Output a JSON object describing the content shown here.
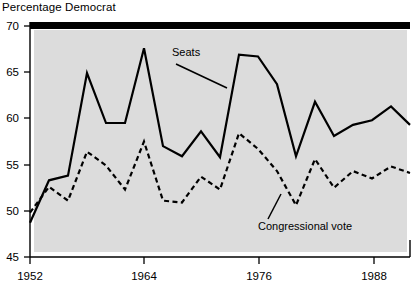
{
  "chart_data": {
    "type": "line",
    "title": "Percentage Democrat",
    "xlabel": "",
    "ylabel": "",
    "xlim": [
      1952,
      1992
    ],
    "ylim": [
      45,
      70
    ],
    "grid": false,
    "legend_position": "inline-annotations",
    "background": "#dcdcdc",
    "x": [
      1952,
      1954,
      1956,
      1958,
      1960,
      1962,
      1964,
      1966,
      1968,
      1970,
      1972,
      1974,
      1976,
      1978,
      1980,
      1982,
      1984,
      1986,
      1988,
      1990,
      1992
    ],
    "xticks": [
      1952,
      1964,
      1976,
      1988
    ],
    "xticklabels": [
      "1952",
      "1964",
      "1976",
      "1988"
    ],
    "yticks": [
      45,
      50,
      55,
      60,
      65,
      70
    ],
    "yticklabels": [
      "45",
      "50",
      "55",
      "60",
      "65",
      "70"
    ],
    "series": [
      {
        "name": "Seats",
        "style": "solid",
        "color": "#000000",
        "values": [
          48.7,
          53.3,
          53.8,
          64.9,
          59.5,
          59.5,
          67.6,
          57.0,
          55.9,
          58.6,
          55.8,
          66.9,
          66.7,
          63.7,
          55.9,
          61.8,
          58.1,
          59.3,
          59.8,
          61.3,
          59.3
        ]
      },
      {
        "name": "Congressional vote",
        "style": "dashed",
        "color": "#000000",
        "values": [
          49.8,
          52.6,
          51.1,
          56.4,
          54.9,
          52.3,
          57.5,
          51.1,
          50.9,
          53.7,
          52.3,
          58.4,
          56.7,
          54.3,
          50.6,
          55.6,
          52.5,
          54.3,
          53.5,
          54.8,
          54.1
        ]
      }
    ],
    "annotations": [
      {
        "text": "Seats",
        "x_px": 172,
        "y_px": 56
      },
      {
        "text": "Congressional vote",
        "x_px": 258,
        "y_px": 227
      }
    ]
  }
}
